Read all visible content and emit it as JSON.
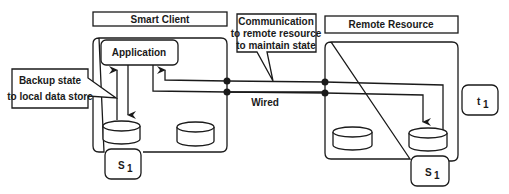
{
  "diagram": {
    "smart_client": {
      "label": "Smart Client"
    },
    "remote_resource": {
      "label": "Remote Resource"
    },
    "application": {
      "label": "Application"
    },
    "callouts": {
      "backup": {
        "line1": "Backup state",
        "line2": "to local data store"
      },
      "communication": {
        "line1": "Communication",
        "line2": "to remote resource",
        "line3": "to maintain state"
      }
    },
    "connection_label": "Wired",
    "state_left": {
      "main": "S",
      "sub": "1"
    },
    "state_right": {
      "main": "S",
      "sub": "1"
    },
    "time": {
      "main": "t",
      "sub": "1"
    }
  },
  "colors": {
    "ink": "#1a1a1a",
    "background": "#ffffff"
  }
}
